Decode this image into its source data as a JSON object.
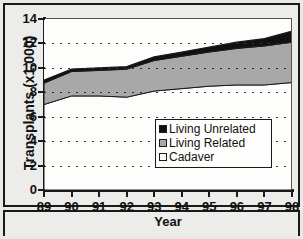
{
  "chart_data": {
    "type": "area",
    "title": "",
    "xlabel": "Year",
    "ylabel": "Transplants (x1,000)",
    "categories": [
      "89",
      "90",
      "91",
      "92",
      "93",
      "94",
      "95",
      "96",
      "97",
      "98"
    ],
    "x": [
      89,
      90,
      91,
      92,
      93,
      94,
      95,
      96,
      97,
      98
    ],
    "xlim": [
      89,
      98
    ],
    "ylim": [
      0,
      14
    ],
    "yticks": [
      0,
      2,
      4,
      6,
      8,
      10,
      12,
      14
    ],
    "xticks": [
      "89",
      "90",
      "91",
      "92",
      "93",
      "94",
      "95",
      "96",
      "97",
      "98"
    ],
    "grid": true,
    "stacked": true,
    "legend_position": "center-right inside plot",
    "series": [
      {
        "name": "Cadaver",
        "color": "#fdfdfc",
        "values": [
          7.0,
          7.7,
          7.7,
          7.6,
          8.1,
          8.3,
          8.5,
          8.6,
          8.6,
          8.8
        ]
      },
      {
        "name": "Living Related",
        "color": "#a8a8a8",
        "values": [
          1.75,
          2.0,
          2.1,
          2.3,
          2.5,
          2.65,
          2.8,
          3.0,
          3.2,
          3.3
        ]
      },
      {
        "name": "Living Unrelated",
        "color": "#111111",
        "values": [
          0.25,
          0.2,
          0.2,
          0.2,
          0.3,
          0.35,
          0.4,
          0.5,
          0.6,
          0.9
        ]
      }
    ],
    "cumulative_totals": [
      9.0,
      9.9,
      10.0,
      10.1,
      10.9,
      11.3,
      11.7,
      12.1,
      12.4,
      13.0
    ]
  },
  "axis": {
    "y_title": "Transplants (x1,000)",
    "x_title": "Year",
    "y_tick_labels": [
      "14",
      "12",
      "10",
      "8",
      "6",
      "4",
      "2",
      "0"
    ],
    "x_tick_labels": [
      "89",
      "90",
      "91",
      "92",
      "93",
      "94",
      "95",
      "96",
      "97",
      "98"
    ]
  },
  "legend": {
    "items": [
      {
        "label": "Living Unrelated",
        "swatch": "#111111"
      },
      {
        "label": "Living Related",
        "swatch": "#a8a8a8"
      },
      {
        "label": "Cadaver",
        "swatch": "#fdfdfc"
      }
    ]
  }
}
